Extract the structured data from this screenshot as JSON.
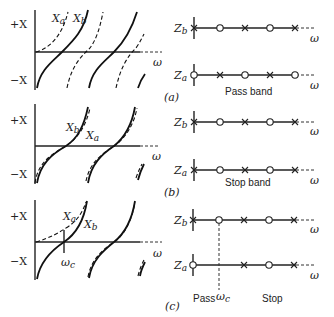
{
  "figure": {
    "y_axis_plus": "+X",
    "y_axis_minus": "−X",
    "x_axis_label": "ω",
    "line_axis_label": "ω",
    "impedance_b": "Zb",
    "impedance_a": "Za",
    "panels": [
      {
        "id": "a",
        "caption": "(a)",
        "reactance_labels": [
          "Xa",
          "Xb"
        ],
        "band_label": "Pass band",
        "Zb_sequence": [
          "pole",
          "zero",
          "pole",
          "zero",
          "pole"
        ],
        "Za_sequence": [
          "zero",
          "pole",
          "zero",
          "pole",
          "zero"
        ]
      },
      {
        "id": "b",
        "caption": "(b)",
        "reactance_labels": [
          "Xb",
          "Xa"
        ],
        "band_label": "Stop band",
        "Zb_sequence": [
          "pole",
          "zero",
          "pole",
          "zero",
          "pole"
        ],
        "Za_sequence": [
          "pole",
          "zero",
          "pole",
          "zero",
          "pole"
        ]
      },
      {
        "id": "c",
        "caption": "(c)",
        "reactance_labels": [
          "Xa",
          "Xb"
        ],
        "cutoff_label": "ωc",
        "pass_label": "Pass",
        "stop_label": "Stop",
        "Zb_sequence": [
          "pole",
          "zero",
          "pole",
          "zero",
          "pole"
        ],
        "Za_sequence": [
          "zero",
          "pole",
          "zero",
          "pole"
        ]
      }
    ]
  }
}
